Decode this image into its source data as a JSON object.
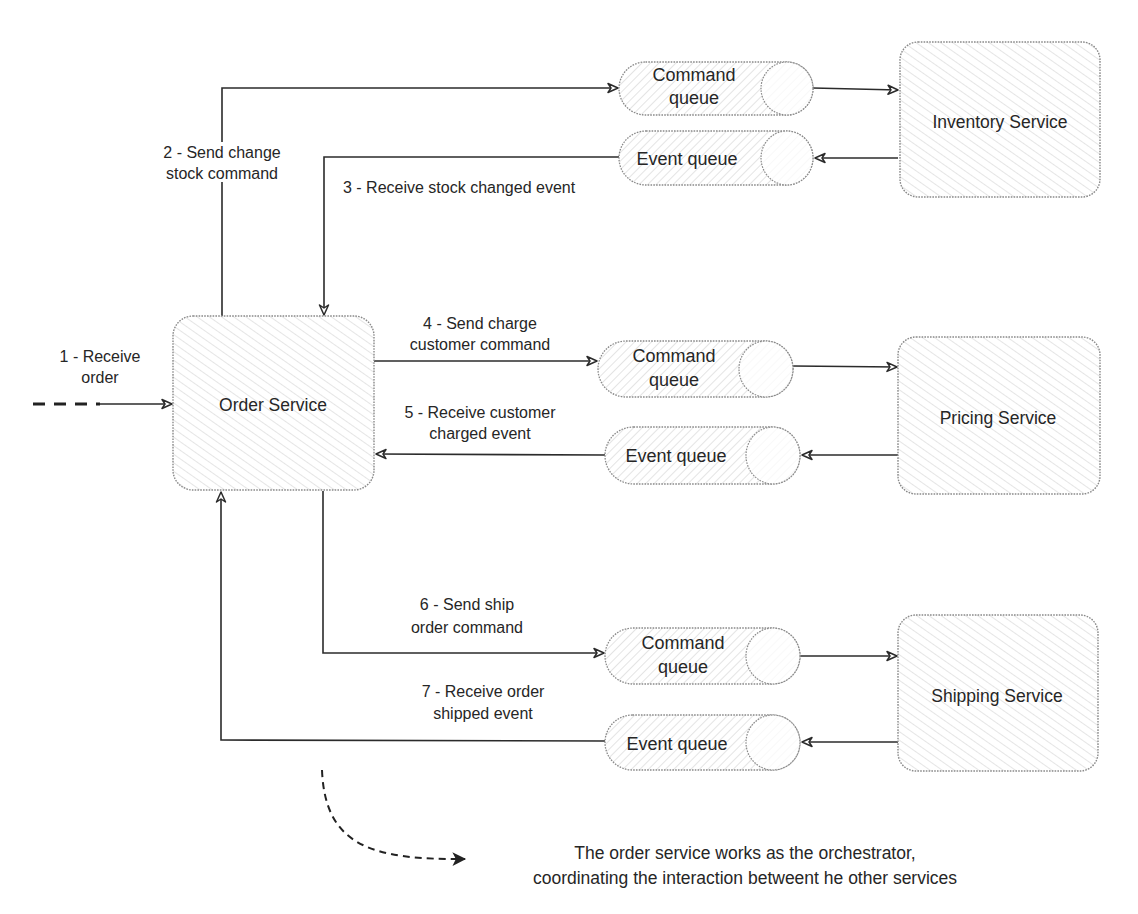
{
  "diagram": {
    "type": "orchestration-saga",
    "colors": {
      "stroke": "#2b2b2b",
      "box_border": "#8a8a8a",
      "hatch": "#d6d6d6",
      "background": "#ffffff"
    },
    "services": {
      "order": {
        "label": "Order Service"
      },
      "inventory": {
        "label": "Inventory Service"
      },
      "pricing": {
        "label": "Pricing Service"
      },
      "shipping": {
        "label": "Shipping Service"
      }
    },
    "queues": {
      "inventory_command": {
        "line1": "Command",
        "line2": "queue"
      },
      "inventory_event": {
        "line1": "Event queue"
      },
      "pricing_command": {
        "line1": "Command",
        "line2": "queue"
      },
      "pricing_event": {
        "line1": "Event queue"
      },
      "shipping_command": {
        "line1": "Command",
        "line2": "queue"
      },
      "shipping_event": {
        "line1": "Event queue"
      }
    },
    "steps": [
      {
        "line1": "1 - Receive",
        "line2": "order"
      },
      {
        "line1": "2 - Send change",
        "line2": "stock command"
      },
      {
        "line1": "3 - Receive stock changed event"
      },
      {
        "line1": "4 - Send charge",
        "line2": "customer command"
      },
      {
        "line1": "5 - Receive customer",
        "line2": "charged event"
      },
      {
        "line1": "6 - Send ship",
        "line2": "order command"
      },
      {
        "line1": "7 - Receive order",
        "line2": "shipped event"
      }
    ],
    "note": {
      "line1": "The order service works as the orchestrator,",
      "line2": "coordinating the interaction betweent he other services"
    }
  }
}
